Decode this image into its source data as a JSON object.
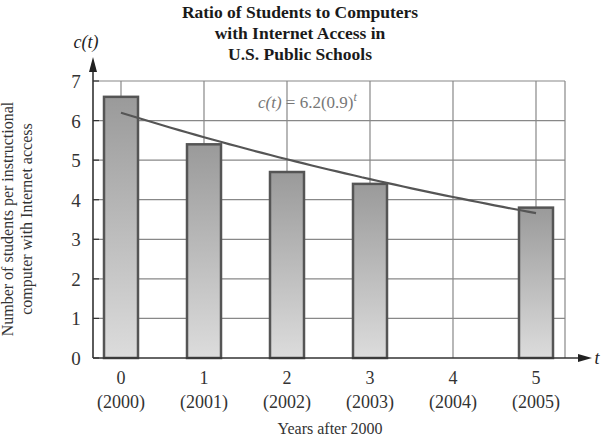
{
  "chart_data": {
    "type": "bar",
    "title": "Ratio of Students to Computers with Internet Access in U.S. Public Schools",
    "title_lines": [
      "Ratio of Students to Computers",
      "with Internet Access in",
      "U.S. Public Schools"
    ],
    "xlabel": "Years after 2000",
    "ylabel": "Number of students per instructional computer with Internet access",
    "ylabel_lines": [
      "Number of students per instructional",
      "computer with Internet access"
    ],
    "y_axis_var": "c(t)",
    "x_axis_var": "t",
    "categories": [
      "0",
      "1",
      "2",
      "3",
      "4",
      "5"
    ],
    "category_years": [
      "(2000)",
      "(2001)",
      "(2002)",
      "(2003)",
      "(2004)",
      "(2005)"
    ],
    "values": [
      6.6,
      5.4,
      4.7,
      4.4,
      null,
      3.8
    ],
    "ylim": [
      0,
      7
    ],
    "yticks": [
      0,
      1,
      2,
      3,
      4,
      5,
      6,
      7
    ],
    "grid": true,
    "model": {
      "label": "c(t) = 6.2(0.9)^t",
      "a": 6.2,
      "b": 0.9,
      "t_range": [
        0,
        5
      ]
    },
    "colors": {
      "bar_top": "#9a9a9a",
      "bar_bottom": "#dcdcdc",
      "bar_border": "#555555",
      "curve": "#555555",
      "grid": "#888888"
    }
  }
}
